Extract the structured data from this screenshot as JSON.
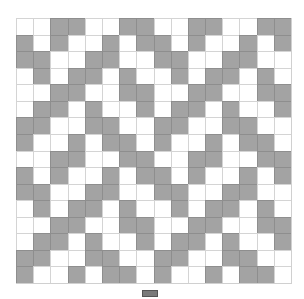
{
  "grid": {
    "rows": 16,
    "cols": 16,
    "colors": {
      "filled": "#a3a3a3",
      "empty": "#ffffff"
    },
    "pattern": [
      "0011001100110011",
      "1010010110100101",
      "1100110011001100",
      "0101101001011010",
      "0011001100110011",
      "0110100101101001",
      "1100110011001100",
      "1001011010010110",
      "0011001100110011",
      "1010010110100101",
      "1100110011001100",
      "0101101001011010",
      "0011001100110011",
      "0110100101101001",
      "1100110011001100",
      "1001011010010110"
    ]
  },
  "legend": {
    "swatch_color": "#7a7a7a",
    "label": ""
  }
}
